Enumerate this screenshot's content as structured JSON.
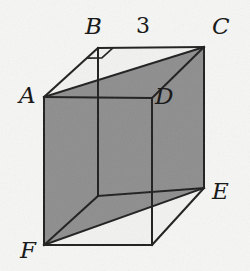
{
  "figure": {
    "kind": "geometry-diagram",
    "canvas": {
      "width": 250,
      "height": 271
    },
    "colors": {
      "background": "#f6f6f4",
      "stroke": "#1d1d1d",
      "shade_fill": "#8d8d8d",
      "label_color": "#1a1a1a",
      "unshaded_face": "#f2f2f0"
    },
    "stroke_width": 2.0
  },
  "vertices": [
    {
      "id": "A",
      "label": "A",
      "x": 44,
      "y": 97,
      "label_x": 19,
      "label_y": 84,
      "role": "front-top-left"
    },
    {
      "id": "B",
      "label": "B",
      "x": 98,
      "y": 48,
      "label_x": 85,
      "label_y": 15,
      "role": "back-top-left"
    },
    {
      "id": "C",
      "label": "C",
      "x": 204,
      "y": 47,
      "label_x": 212,
      "label_y": 15,
      "role": "back-top-right"
    },
    {
      "id": "D",
      "label": "D",
      "x": 152,
      "y": 98,
      "label_x": 155,
      "label_y": 85,
      "role": "front-top-right"
    },
    {
      "id": "E",
      "label": "E",
      "x": 204,
      "y": 188,
      "label_x": 212,
      "label_y": 180,
      "role": "back-bottom-right"
    },
    {
      "id": "F",
      "label": "F",
      "x": 44,
      "y": 245,
      "label_x": 20,
      "label_y": 239,
      "role": "front-bottom-left"
    }
  ],
  "unlabeled_vertices": [
    {
      "id": "G",
      "x": 152,
      "y": 245,
      "role": "front-bottom-right"
    },
    {
      "id": "H",
      "x": 98,
      "y": 196,
      "role": "back-bottom-left-hidden"
    }
  ],
  "measurements": [
    {
      "id": "BC",
      "label": "3",
      "value": 3,
      "edge": "B-C",
      "label_x": 136,
      "label_y": 15
    }
  ],
  "angle_marks": [
    {
      "id": "right-angle-at-B",
      "at_vertex": "B",
      "type": "right-angle",
      "between_edges": [
        "B-A",
        "B-C"
      ]
    }
  ],
  "shaded_region": {
    "name": "shaded-cross-section",
    "vertices": [
      "A",
      "C",
      "E",
      "F"
    ],
    "note": "Quadrilateral plane A-C-E-F cutting through the box, drawn in gray"
  },
  "edges": [
    {
      "id": "A-B",
      "from": "A",
      "to": "B",
      "style": "solid"
    },
    {
      "id": "B-C",
      "from": "B",
      "to": "C",
      "style": "solid"
    },
    {
      "id": "C-D",
      "from": "C",
      "to": "D",
      "style": "solid"
    },
    {
      "id": "D-A",
      "from": "D",
      "to": "A",
      "style": "solid"
    },
    {
      "id": "A-F",
      "from": "A",
      "to": "F",
      "style": "solid"
    },
    {
      "id": "C-E",
      "from": "C",
      "to": "E",
      "style": "solid"
    },
    {
      "id": "D-G",
      "from": "D",
      "to": "G",
      "style": "solid"
    },
    {
      "id": "F-G",
      "from": "F",
      "to": "G",
      "style": "solid"
    },
    {
      "id": "G-E",
      "from": "G",
      "to": "E",
      "style": "solid"
    },
    {
      "id": "B-H",
      "from": "B",
      "to": "H",
      "style": "solid"
    },
    {
      "id": "H-F",
      "from": "H",
      "to": "F",
      "style": "solid"
    },
    {
      "id": "H-E",
      "from": "H",
      "to": "E",
      "style": "solid"
    },
    {
      "id": "A-C",
      "from": "A",
      "to": "C",
      "style": "solid"
    },
    {
      "id": "F-E",
      "from": "F",
      "to": "E",
      "style": "solid"
    }
  ]
}
